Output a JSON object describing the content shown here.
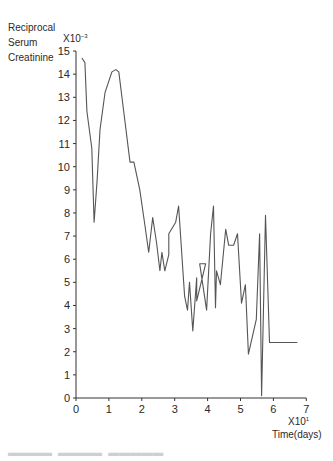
{
  "chart_data": {
    "type": "line",
    "title": "",
    "ylabel": "Reciprocal Serum Creatinine",
    "ylabel_lines": [
      "Reciprocal",
      "Serum",
      "Creatinine"
    ],
    "y_multiplier": "X10",
    "y_multiplier_exp": "-3",
    "xlabel": "Time(days)",
    "x_multiplier": "X10",
    "x_multiplier_exp": "1",
    "xlim": [
      0,
      7
    ],
    "ylim": [
      0,
      15
    ],
    "x_ticks": [
      "0",
      "1",
      "2",
      "3",
      "4",
      "5",
      "6",
      "7"
    ],
    "y_ticks": [
      "0",
      "1",
      "2",
      "3",
      "4",
      "5",
      "6",
      "7",
      "8",
      "9",
      "10",
      "11",
      "12",
      "13",
      "14",
      "15"
    ],
    "grid": false,
    "legend": null,
    "series": [
      {
        "name": "Reciprocal serum creatinine",
        "x": [
          0.18,
          0.27,
          0.33,
          0.48,
          0.55,
          0.64,
          0.73,
          0.88,
          1.09,
          1.21,
          1.3,
          1.45,
          1.64,
          1.76,
          1.94,
          2.09,
          2.21,
          2.33,
          2.45,
          2.55,
          2.61,
          2.7,
          2.82,
          2.82,
          3.03,
          3.12,
          3.3,
          3.39,
          3.45,
          3.55,
          3.67,
          3.67,
          3.94,
          3.76,
          3.97,
          4.09,
          4.18,
          4.24,
          4.27,
          4.39,
          4.55,
          4.64,
          4.79,
          4.91,
          5.03,
          5.15,
          5.24,
          5.48,
          5.58,
          5.64,
          5.76,
          5.88,
          6.12,
          6.48,
          6.73
        ],
        "y": [
          14.7,
          14.5,
          12.4,
          10.8,
          7.6,
          9.4,
          11.6,
          13.2,
          14.1,
          14.2,
          14.1,
          12.4,
          10.2,
          10.2,
          9.0,
          7.5,
          6.3,
          7.8,
          6.7,
          5.5,
          6.3,
          5.5,
          6.2,
          7.1,
          7.6,
          8.3,
          4.4,
          3.8,
          5.0,
          2.9,
          5.2,
          4.2,
          5.8,
          5.8,
          3.8,
          7.1,
          8.3,
          3.9,
          5.5,
          4.9,
          7.3,
          6.6,
          6.6,
          7.1,
          4.1,
          4.9,
          1.9,
          3.4,
          7.1,
          0.1,
          7.9,
          2.4,
          2.4,
          2.4,
          2.4
        ]
      }
    ],
    "points_scaled_note": "x in units of 10 days, y in units of 1e-3"
  },
  "labels": {
    "y1": "Reciprocal",
    "y2": "Serum",
    "y3": "Creatinine",
    "ymult": "X10",
    "ymult_exp": "−3",
    "xmult": "X10",
    "xmult_exp": "1",
    "xtitle": "Time(days)"
  },
  "style": {
    "line_color": "#555555",
    "axis_color": "#333333"
  }
}
